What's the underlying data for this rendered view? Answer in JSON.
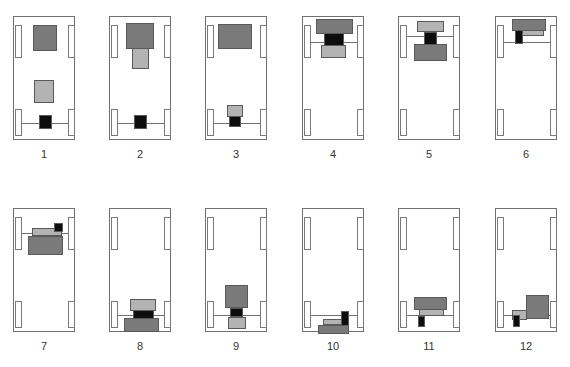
{
  "figure": {
    "title": "",
    "colors": {
      "outline": "#6f6f6f",
      "dark": "#7a7a7a",
      "light": "#b3b3b3",
      "black": "#0d0d0d",
      "background": "#ffffff"
    },
    "panel_size": [
      62,
      124
    ],
    "panels": [
      {
        "label": "1",
        "origin": [
          13,
          16
        ],
        "axles": [
          106
        ],
        "blocks": [
          {
            "type": "dark",
            "rect": [
              19,
              8,
              24,
              26
            ]
          },
          {
            "type": "light",
            "rect": [
              20,
              63,
              20,
              23
            ]
          },
          {
            "type": "black",
            "rect": [
              25,
              98,
              13,
              14
            ]
          }
        ]
      },
      {
        "label": "2",
        "origin": [
          109,
          16
        ],
        "axles": [
          106
        ],
        "blocks": [
          {
            "type": "light",
            "rect": [
              22,
              30,
              17,
              22
            ]
          },
          {
            "type": "dark",
            "rect": [
              16,
              6,
              28,
              26
            ]
          },
          {
            "type": "black",
            "rect": [
              24,
              98,
              13,
              14
            ]
          }
        ]
      },
      {
        "label": "3",
        "origin": [
          205,
          16
        ],
        "axles": [
          106
        ],
        "blocks": [
          {
            "type": "dark",
            "rect": [
              12,
              7,
              34,
              25
            ]
          },
          {
            "type": "black",
            "rect": [
              23,
              99,
              12,
              11
            ]
          },
          {
            "type": "light",
            "rect": [
              21,
              88,
              16,
              12
            ]
          }
        ]
      },
      {
        "label": "4",
        "origin": [
          302,
          16
        ],
        "axles": [
          25
        ],
        "blocks": [
          {
            "type": "light",
            "rect": [
              18,
              28,
              25,
              13
            ]
          },
          {
            "type": "black",
            "rect": [
              21,
              16,
              20,
              13
            ]
          },
          {
            "type": "dark",
            "rect": [
              13,
              2,
              37,
              15
            ]
          }
        ]
      },
      {
        "label": "5",
        "origin": [
          398,
          16
        ],
        "axles": [
          19
        ],
        "blocks": [
          {
            "type": "light",
            "rect": [
              18,
              4,
              27,
              11
            ]
          },
          {
            "type": "black",
            "rect": [
              25,
              15,
              13,
              13
            ]
          },
          {
            "type": "dark",
            "rect": [
              15,
              27,
              33,
              17
            ]
          }
        ]
      },
      {
        "label": "6",
        "origin": [
          495,
          16
        ],
        "axles": [
          25
        ],
        "blocks": [
          {
            "type": "light",
            "rect": [
              26,
              13,
              22,
              6
            ]
          },
          {
            "type": "dark",
            "rect": [
              16,
              2,
              34,
              12
            ]
          },
          {
            "type": "black",
            "rect": [
              19,
              13,
              8,
              14
            ]
          }
        ]
      },
      {
        "label": "7",
        "origin": [
          13,
          208
        ],
        "axles": [
          24
        ],
        "blocks": [
          {
            "type": "light",
            "rect": [
              18,
              19,
              30,
              8
            ]
          },
          {
            "type": "dark",
            "rect": [
              14,
              27,
              35,
              19
            ]
          },
          {
            "type": "black",
            "rect": [
              40,
              14,
              9,
              9
            ]
          }
        ]
      },
      {
        "label": "8",
        "origin": [
          109,
          208
        ],
        "axles": [
          106
        ],
        "blocks": [
          {
            "type": "light",
            "rect": [
              20,
              90,
              26,
              12
            ]
          },
          {
            "type": "black",
            "rect": [
              23,
              101,
              21,
              9
            ]
          },
          {
            "type": "dark",
            "rect": [
              14,
              109,
              35,
              14
            ]
          }
        ]
      },
      {
        "label": "9",
        "origin": [
          205,
          208
        ],
        "axles": [
          106
        ],
        "blocks": [
          {
            "type": "dark",
            "rect": [
              19,
              76,
              23,
              23
            ]
          },
          {
            "type": "black",
            "rect": [
              24,
              99,
              13,
              9
            ]
          },
          {
            "type": "light",
            "rect": [
              22,
              108,
              18,
              12
            ]
          }
        ]
      },
      {
        "label": "10",
        "origin": [
          302,
          208
        ],
        "axles": [
          106
        ],
        "blocks": [
          {
            "type": "light",
            "rect": [
              20,
              110,
              22,
              6
            ]
          },
          {
            "type": "dark",
            "rect": [
              15,
              116,
              31,
              9
            ]
          },
          {
            "type": "black",
            "rect": [
              38,
              102,
              8,
              15
            ]
          }
        ]
      },
      {
        "label": "11",
        "origin": [
          398,
          208
        ],
        "axles": [
          106
        ],
        "blocks": [
          {
            "type": "light",
            "rect": [
              20,
              100,
              25,
              7
            ]
          },
          {
            "type": "dark",
            "rect": [
              15,
              88,
              33,
              13
            ]
          },
          {
            "type": "black",
            "rect": [
              19,
              107,
              7,
              11
            ]
          }
        ]
      },
      {
        "label": "12",
        "origin": [
          495,
          208
        ],
        "axles": [
          106
        ],
        "blocks": [
          {
            "type": "light",
            "rect": [
              16,
              101,
              15,
              10
            ]
          },
          {
            "type": "dark",
            "rect": [
              30,
              86,
              23,
              24
            ]
          },
          {
            "type": "black",
            "rect": [
              17,
              106,
              7,
              12
            ]
          }
        ]
      }
    ],
    "wheels": {
      "top": {
        "y": 8,
        "h": 33
      },
      "bottom": {
        "y": 92,
        "h": 27
      },
      "left_x": 1,
      "right_x": 54,
      "w": 7
    }
  }
}
